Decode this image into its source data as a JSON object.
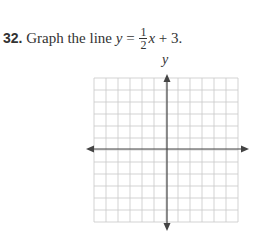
{
  "problem": {
    "number": "32.",
    "text": "Graph the line",
    "equation": {
      "lhs": "y",
      "equals": "=",
      "frac_num": "1",
      "frac_den": "2",
      "var": "x",
      "rest": "+ 3."
    }
  },
  "graph": {
    "y_axis_label": "y",
    "grid_columns": 12,
    "grid_rows": 12,
    "grid_color": "#c8c8c8",
    "axis_color": "#444444"
  }
}
